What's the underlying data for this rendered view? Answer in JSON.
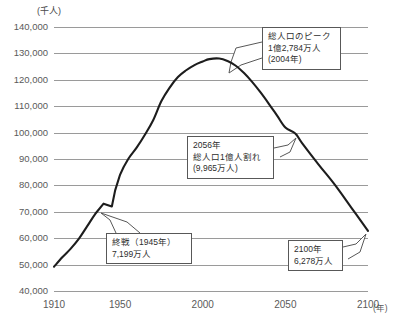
{
  "chart_data": {
    "type": "line",
    "title": "",
    "xlabel": "(年)",
    "ylabel": "(千人)",
    "xlim": [
      1910,
      2100
    ],
    "ylim": [
      40000,
      140000
    ],
    "grid": true,
    "legend": "none",
    "x_ticks": [
      "1910",
      "1950",
      "2000",
      "2050",
      "2100"
    ],
    "y_ticks": [
      "140,000",
      "130,000",
      "120,000",
      "110,000",
      "100,000",
      "90,000",
      "80,000",
      "70,000",
      "60,000",
      "50,000",
      "40,000"
    ],
    "series": [
      {
        "name": "日本の総人口",
        "x": [
          1910,
          1915,
          1920,
          1925,
          1930,
          1935,
          1940,
          1945,
          1947,
          1950,
          1955,
          1960,
          1965,
          1970,
          1975,
          1980,
          1985,
          1990,
          1995,
          2000,
          2004,
          2010,
          2015,
          2020,
          2025,
          2030,
          2035,
          2040,
          2045,
          2050,
          2056,
          2060,
          2070,
          2080,
          2090,
          2100
        ],
        "values": [
          49184,
          52752,
          55963,
          59737,
          64450,
          69254,
          73075,
          71998,
          78101,
          84115,
          90077,
          94302,
          99209,
          104665,
          111940,
          117060,
          121049,
          123611,
          125570,
          126926,
          127840,
          128057,
          127095,
          125325,
          122544,
          119125,
          115216,
          110919,
          106421,
          101923,
          99650,
          96148,
          88000,
          80200,
          71500,
          62780
        ]
      }
    ],
    "annotations": [
      {
        "id": "peak",
        "lines": [
          "総人口のピーク",
          "1億2,784万人",
          "(2004年)"
        ],
        "point_year": 2004,
        "point_value": 127840
      },
      {
        "id": "below-100m",
        "lines": [
          "2056年",
          "総人口1億人割れ",
          "(9,965万人)"
        ],
        "point_year": 2056,
        "point_value": 99650
      },
      {
        "id": "end-of-war",
        "lines": [
          "終戦（1945年）",
          "7,199万人"
        ],
        "point_year": 1945,
        "point_value": 71998
      },
      {
        "id": "year-2100",
        "lines": [
          "2100年",
          "6,278万人"
        ],
        "point_year": 2100,
        "point_value": 62780
      }
    ]
  }
}
